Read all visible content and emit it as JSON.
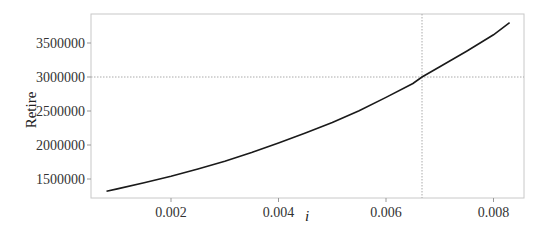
{
  "chart_data": {
    "type": "line",
    "title": "",
    "xlabel": "i",
    "ylabel": "Retire",
    "xlim": [
      0.0006,
      0.0087
    ],
    "ylim": [
      1220000,
      3870000
    ],
    "grid": false,
    "legend": null,
    "x_ticks": [
      0.002,
      0.004,
      0.006,
      0.008
    ],
    "x_tick_labels": [
      "0.002",
      "0.004",
      "0.006",
      "0.008"
    ],
    "y_ticks": [
      1500000,
      2000000,
      2500000,
      3000000,
      3500000
    ],
    "y_tick_labels": [
      "1500000",
      "2000000",
      "2500000",
      "3000000",
      "3500000"
    ],
    "series": [
      {
        "name": "Retire",
        "color": "#1a1a1a",
        "x": [
          0.0008,
          0.001,
          0.0015,
          0.002,
          0.0025,
          0.003,
          0.0035,
          0.004,
          0.0045,
          0.005,
          0.0055,
          0.006,
          0.0065,
          0.00667,
          0.007,
          0.0075,
          0.008,
          0.0083
        ],
        "values": [
          1320000,
          1355000,
          1445000,
          1540000,
          1645000,
          1760000,
          1890000,
          2030000,
          2175000,
          2330000,
          2505000,
          2700000,
          2905000,
          3000000,
          3150000,
          3380000,
          3620000,
          3800000
        ]
      }
    ],
    "annotations": [
      {
        "type": "vline",
        "x": 0.00667,
        "style": "dotted",
        "color": "#aaaaaa"
      },
      {
        "type": "hline",
        "y": 3000000,
        "style": "dotted",
        "color": "#aaaaaa"
      }
    ]
  }
}
